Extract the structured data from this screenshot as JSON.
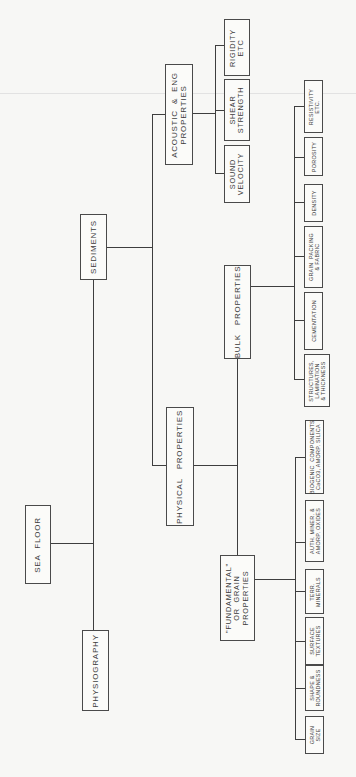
{
  "diagram": {
    "orientation": "rotated-90-ccw",
    "root": {
      "label": "SEA  FLOOR"
    },
    "level1": {
      "physiography": {
        "label": "PHYSIOGRAPHY"
      },
      "sediments": {
        "label": "SEDIMENTS"
      }
    },
    "level2": {
      "physical_properties": {
        "label": "PHYSICAL   PROPERTIES"
      },
      "acoustic_eng": {
        "label": "ACOUSTIC  &  ENG\nPROPERTIES"
      }
    },
    "level3": {
      "bulk_properties": {
        "label": "BULK   PROPERTIES"
      },
      "grain_properties": {
        "label": "\"FUNDAMENTAL\"\nOR  GRAIN\nPROPERTIES"
      }
    },
    "acoustic_children": [
      {
        "label": "SOUND\nVELOCITY"
      },
      {
        "label": "SHEAR\nSTRENGTH"
      },
      {
        "label": "RIGIDITY\nETC"
      }
    ],
    "bulk_children": [
      {
        "label": "RESISTIVITY\nETC."
      },
      {
        "label": "POROSITY"
      },
      {
        "label": "DENSITY"
      },
      {
        "label": "GRAIN  PACKING\n& FABRIC"
      },
      {
        "label": "CEMENTATION"
      },
      {
        "label": "STRUCTURES,\nLAMINATION\n& THICKNESS"
      }
    ],
    "grain_children": [
      {
        "label": "BIOGENIC  COMPONENTS\nCaCO3, AMORP. SILICA"
      },
      {
        "label": "AUTH. MINER. &\nAMORP. OXIDES"
      },
      {
        "label": "TERR.\nMINERALS"
      },
      {
        "label": "SURFACE\nTEXTURES"
      },
      {
        "label": "SHAPE &\nROUNDNESS"
      },
      {
        "label": "GRAIN\nSIZE"
      }
    ]
  }
}
